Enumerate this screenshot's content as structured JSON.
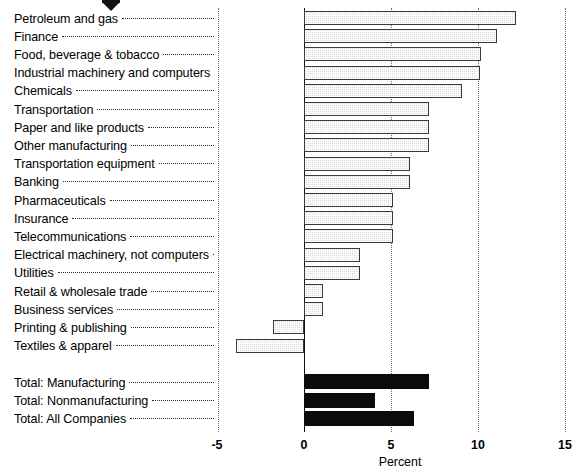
{
  "chart_data": {
    "type": "bar",
    "orientation": "horizontal",
    "title": "",
    "subtitle": "",
    "xlabel": "Percent",
    "ylabel": "",
    "xlim": [
      -5,
      15
    ],
    "xticks": [
      -5,
      0,
      5,
      10,
      15
    ],
    "xtick_labels": [
      "-5",
      "0",
      "5",
      "10",
      "15"
    ],
    "grid": true,
    "grid_axis": "x",
    "legend": "none",
    "categories": [
      "Petroleum and gas",
      "Finance",
      "Food, beverage & tobacco",
      "Industrial machinery and computers",
      "Chemicals",
      "Transportation",
      "Paper and like products",
      "Other manufacturing",
      "Transportation equipment",
      "Banking",
      "Pharmaceuticals",
      "Insurance",
      "Telecommunications",
      "Electrical machinery, not computers",
      "Utilities",
      "Retail & wholesale trade",
      "Business services",
      "Printing & publishing",
      "Textiles & apparel",
      "Total: Manufacturing",
      "Total: Nonmanufacturing",
      "Total: All Companies"
    ],
    "values": [
      12.2,
      11.1,
      10.2,
      10.1,
      9.1,
      7.2,
      7.2,
      7.2,
      6.1,
      6.1,
      5.1,
      5.1,
      5.1,
      3.2,
      3.2,
      1.1,
      1.1,
      -1.8,
      -3.9,
      7.2,
      4.1,
      6.3
    ],
    "series": [
      {
        "name": "Percent",
        "values": [
          12.2,
          11.1,
          10.2,
          10.1,
          9.1,
          7.2,
          7.2,
          7.2,
          6.1,
          6.1,
          5.1,
          5.1,
          5.1,
          3.2,
          3.2,
          1.1,
          1.1,
          -1.8,
          -3.9,
          7.2,
          4.1,
          6.3
        ]
      }
    ],
    "bar_styles": [
      "hatched",
      "hatched",
      "hatched",
      "hatched",
      "hatched",
      "hatched",
      "hatched",
      "hatched",
      "hatched",
      "hatched",
      "hatched",
      "hatched",
      "hatched",
      "hatched",
      "hatched",
      "hatched",
      "hatched",
      "hatched",
      "hatched",
      "solid",
      "solid",
      "solid"
    ],
    "group_break_after_index": 18,
    "annotations": [
      {
        "name": "marker-arrow",
        "points_to": "Petroleum and gas",
        "shape": "down-arrow"
      }
    ],
    "colors": {
      "hatched_fill": "#d8d8d8",
      "hatched_border": "#3a3a3a",
      "solid_fill": "#0b0b0b",
      "axis": "#111111",
      "grid": "#6e6e6e",
      "text": "#000000",
      "background": "#ffffff"
    }
  }
}
